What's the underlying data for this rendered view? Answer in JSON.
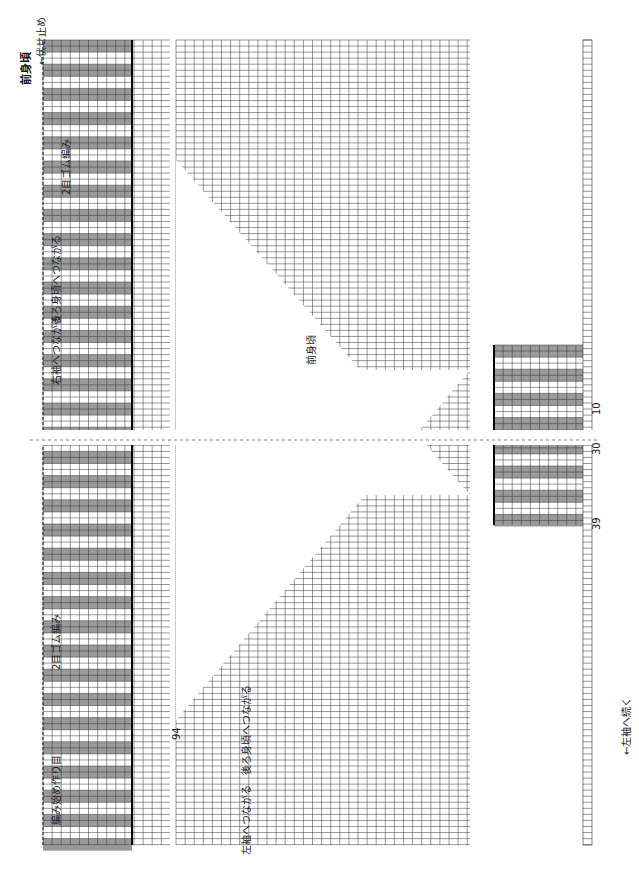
{
  "title": "前身頃",
  "center_label": "前身頃",
  "colors": {
    "grid": "#333333",
    "ribbing_fill": "#9a9a9a",
    "background": "#ffffff",
    "bold_line": "#000000"
  },
  "top_labels": {
    "bind_off": "←伏せ止め",
    "ribbing": "2目ゴム編み",
    "connect_back": "後ろ身頃へつながる",
    "right_sleeve": "右袖へつながる",
    "left_sleeve_continue": "←左袖へ続く",
    "connect_back_bottom": "後ろ身頃へつながる",
    "left_sleeve_connect": "左袖へつながる",
    "cast_on": "作り目",
    "start": "編み始め",
    "row1": "1目",
    "row2": "2段",
    "row1b": "1段"
  },
  "row_labels": [
    {
      "text": "15(150)",
      "pos": 0
    },
    {
      "text": "10(145)",
      "pos": 5
    },
    {
      "text": "1(136)",
      "pos": 14
    },
    {
      "text": "120(135)",
      "pos": 15
    },
    {
      "text": "116(131)",
      "pos": 19
    },
    {
      "text": "53(68)",
      "pos": 23
    },
    {
      "text": "49(64)",
      "pos": 27
    },
    {
      "text": "48(63)",
      "pos": 28
    },
    {
      "text": "40(55)",
      "pos": 36
    },
    {
      "text": "30(45)",
      "pos": 46
    },
    {
      "text": "20(35)",
      "pos": 56
    },
    {
      "text": "10(25)",
      "pos": 66
    },
    {
      "text": "1(16)",
      "pos": 75
    },
    {
      "text": "15",
      "pos": 76
    },
    {
      "text": "10",
      "pos": 81
    },
    {
      "text": "2目ゴム編み",
      "pos": 85
    }
  ],
  "stitch_labels": {
    "col_94": "94",
    "col_39": "39",
    "col_30": "30",
    "col_10": "10"
  },
  "chart_data": {
    "type": "knitting-chart",
    "title": "前身頃",
    "rows_upper_ribbing": 15,
    "rows_body": 120,
    "stitches": 94,
    "ribbing": "2目ゴム編み",
    "annotations": [
      "伏せ止め",
      "後ろ身頃へつながる",
      "右袖へつながる",
      "左袖へつながる",
      "左袖へ続く",
      "作り目",
      "編み始め"
    ]
  }
}
